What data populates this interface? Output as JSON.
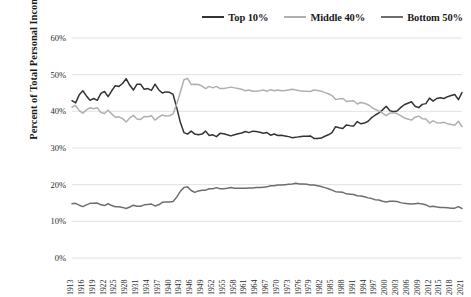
{
  "legend": {
    "position": "top-right",
    "items": [
      {
        "label": "Top 10%",
        "color": "#333333"
      },
      {
        "label": "Middle 40%",
        "color": "#b0b0b0"
      },
      {
        "label": "Bottom 50%",
        "color": "#6e6e6e"
      }
    ]
  },
  "axes": {
    "ylabel": "Percent of Total Personal Income",
    "xlabel": "",
    "yticks": [
      "0%",
      "10%",
      "20%",
      "30%",
      "40%",
      "50%",
      "60%"
    ],
    "xticks": [
      "1913",
      "1916",
      "1919",
      "1922",
      "1925",
      "1928",
      "1931",
      "1934",
      "1937",
      "1940",
      "1943",
      "1946",
      "1949",
      "1952",
      "1955",
      "1958",
      "1961",
      "1964",
      "1967",
      "1970",
      "1973",
      "1976",
      "1979",
      "1982",
      "1985",
      "1988",
      "1991",
      "1994",
      "1997",
      "2000",
      "2003",
      "2006",
      "2009",
      "2012",
      "2015",
      "2018",
      "2021"
    ]
  },
  "chart_data": {
    "type": "line",
    "title": "",
    "subtitle": "",
    "xlabel": "",
    "ylabel": "Percent of Total Personal Income",
    "ylim": [
      0,
      60
    ],
    "xlim": [
      1913,
      2021
    ],
    "ytick_step": 10,
    "xtick_step": 3,
    "grid": "horizontal",
    "legend_position": "top-right",
    "x": [
      1913,
      1914,
      1915,
      1916,
      1917,
      1918,
      1919,
      1920,
      1921,
      1922,
      1923,
      1924,
      1925,
      1926,
      1927,
      1928,
      1929,
      1930,
      1931,
      1932,
      1933,
      1934,
      1935,
      1936,
      1937,
      1938,
      1939,
      1940,
      1941,
      1942,
      1943,
      1944,
      1945,
      1946,
      1947,
      1948,
      1949,
      1950,
      1951,
      1952,
      1953,
      1954,
      1955,
      1956,
      1957,
      1958,
      1959,
      1960,
      1961,
      1962,
      1963,
      1964,
      1965,
      1966,
      1967,
      1968,
      1969,
      1970,
      1971,
      1972,
      1973,
      1974,
      1975,
      1976,
      1977,
      1978,
      1979,
      1980,
      1981,
      1982,
      1983,
      1984,
      1985,
      1986,
      1987,
      1988,
      1989,
      1990,
      1991,
      1992,
      1993,
      1994,
      1995,
      1996,
      1997,
      1998,
      1999,
      2000,
      2001,
      2002,
      2003,
      2004,
      2005,
      2006,
      2007,
      2008,
      2009,
      2010,
      2011,
      2012,
      2013,
      2014,
      2015,
      2016,
      2017,
      2018,
      2019,
      2020,
      2021
    ],
    "series": [
      {
        "name": "Top 10%",
        "color": "#333333",
        "values": [
          42.9,
          42.3,
          44.5,
          45.6,
          44.2,
          43.0,
          43.5,
          43.0,
          44.9,
          45.4,
          44.0,
          45.6,
          47.0,
          46.8,
          47.6,
          48.9,
          47.1,
          45.8,
          47.4,
          47.4,
          46.0,
          46.2,
          45.7,
          47.4,
          45.9,
          45.0,
          45.3,
          45.2,
          44.6,
          41.0,
          37.0,
          34.2,
          33.8,
          34.6,
          33.8,
          33.6,
          33.8,
          34.6,
          33.4,
          33.6,
          33.1,
          34.0,
          33.9,
          33.6,
          33.3,
          33.6,
          33.9,
          34.1,
          34.5,
          34.2,
          34.6,
          34.5,
          34.3,
          34.0,
          34.2,
          33.5,
          33.8,
          33.4,
          33.5,
          33.3,
          33.1,
          32.8,
          32.9,
          33.1,
          33.2,
          33.2,
          33.3,
          32.6,
          32.6,
          32.7,
          33.2,
          33.6,
          34.2,
          35.8,
          35.5,
          35.3,
          36.3,
          36.1,
          36.0,
          37.2,
          36.6,
          36.8,
          37.3,
          38.3,
          39.0,
          39.6,
          40.4,
          41.4,
          40.2,
          39.9,
          40.1,
          41.0,
          41.8,
          42.2,
          42.6,
          41.4,
          41.0,
          41.9,
          42.1,
          43.6,
          42.8,
          43.5,
          43.7,
          43.5,
          44.0,
          44.3,
          44.6,
          43.2,
          45.1
        ]
      },
      {
        "name": "Middle 40%",
        "color": "#b0b0b0",
        "values": [
          41.2,
          41.6,
          40.2,
          39.5,
          40.4,
          41.0,
          40.7,
          41.0,
          39.7,
          39.4,
          40.3,
          39.3,
          38.4,
          38.5,
          38.0,
          37.1,
          38.2,
          38.9,
          37.9,
          37.8,
          38.6,
          38.5,
          38.8,
          37.6,
          38.4,
          39.0,
          38.7,
          38.8,
          39.3,
          42.0,
          45.2,
          48.6,
          49.0,
          47.3,
          47.4,
          47.3,
          46.9,
          46.2,
          46.8,
          46.4,
          46.8,
          46.2,
          46.2,
          46.4,
          46.6,
          46.4,
          46.2,
          46.0,
          45.6,
          45.8,
          45.5,
          45.5,
          45.6,
          45.8,
          45.5,
          45.9,
          45.6,
          45.8,
          45.6,
          45.7,
          45.8,
          46.0,
          45.8,
          45.6,
          45.5,
          45.5,
          45.4,
          45.8,
          45.7,
          45.5,
          45.1,
          44.8,
          44.3,
          43.2,
          43.4,
          43.5,
          42.7,
          42.8,
          42.9,
          42.0,
          42.4,
          42.2,
          41.8,
          41.1,
          40.5,
          40.1,
          39.5,
          38.8,
          39.5,
          39.6,
          39.4,
          38.8,
          38.2,
          37.9,
          37.6,
          38.4,
          38.7,
          38.0,
          37.9,
          36.8,
          37.4,
          36.9,
          36.8,
          37.0,
          36.6,
          36.4,
          36.2,
          37.3,
          35.8
        ]
      },
      {
        "name": "Bottom 50%",
        "color": "#6e6e6e",
        "values": [
          14.8,
          14.9,
          14.4,
          14.0,
          14.5,
          14.9,
          14.9,
          15.0,
          14.5,
          14.3,
          14.8,
          14.3,
          14.0,
          14.0,
          13.8,
          13.5,
          13.9,
          14.4,
          14.1,
          14.1,
          14.5,
          14.6,
          14.7,
          14.2,
          14.5,
          15.2,
          15.3,
          15.3,
          15.4,
          16.6,
          18.2,
          19.2,
          19.4,
          18.4,
          17.9,
          18.3,
          18.5,
          18.5,
          18.9,
          18.9,
          19.2,
          18.9,
          18.9,
          19.0,
          19.2,
          19.0,
          19.0,
          19.0,
          19.0,
          19.1,
          19.1,
          19.2,
          19.2,
          19.3,
          19.4,
          19.7,
          19.7,
          19.9,
          19.9,
          20.0,
          20.1,
          20.2,
          20.4,
          20.2,
          20.2,
          20.1,
          19.9,
          19.9,
          19.7,
          19.5,
          19.2,
          18.9,
          18.5,
          18.1,
          18.0,
          17.9,
          17.5,
          17.4,
          17.3,
          17.0,
          16.9,
          16.7,
          16.4,
          16.2,
          15.9,
          15.8,
          15.5,
          15.3,
          15.5,
          15.5,
          15.4,
          15.1,
          14.9,
          14.8,
          14.7,
          14.8,
          14.9,
          14.7,
          14.5,
          14.0,
          14.1,
          13.9,
          13.8,
          13.8,
          13.7,
          13.6,
          13.6,
          14.0,
          13.5
        ]
      }
    ]
  }
}
